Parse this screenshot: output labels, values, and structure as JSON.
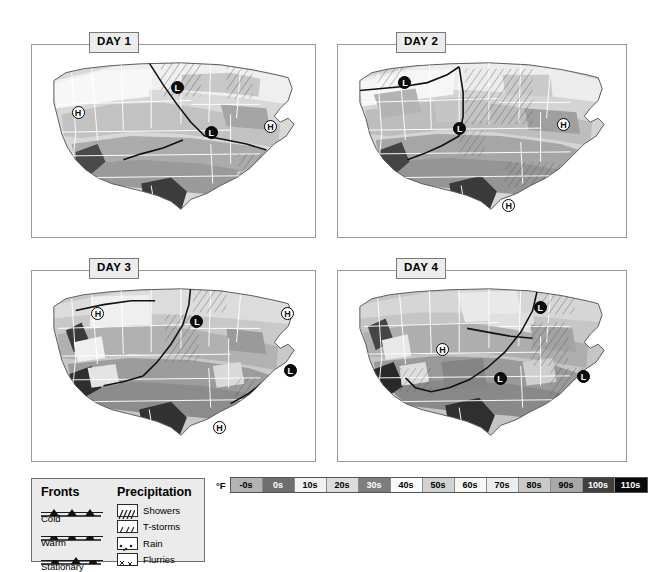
{
  "panels": [
    {
      "id": "day1",
      "label": "DAY 1",
      "markers": [
        {
          "type": "H",
          "x": 14,
          "y": 32
        },
        {
          "type": "L",
          "x": 49,
          "y": 19
        },
        {
          "type": "L",
          "x": 61,
          "y": 42
        },
        {
          "type": "H",
          "x": 82,
          "y": 39
        }
      ]
    },
    {
      "id": "day2",
      "label": "DAY 2",
      "markers": [
        {
          "type": "L",
          "x": 21,
          "y": 16
        },
        {
          "type": "L",
          "x": 40,
          "y": 40
        },
        {
          "type": "H",
          "x": 76,
          "y": 38
        },
        {
          "type": "H",
          "x": 57,
          "y": 80
        }
      ]
    },
    {
      "id": "day3",
      "label": "DAY 3",
      "markers": [
        {
          "type": "H",
          "x": 21,
          "y": 19
        },
        {
          "type": "L",
          "x": 56,
          "y": 23
        },
        {
          "type": "H",
          "x": 88,
          "y": 19
        },
        {
          "type": "L",
          "x": 89,
          "y": 49
        },
        {
          "type": "H",
          "x": 64,
          "y": 79
        }
      ]
    },
    {
      "id": "day4",
      "label": "DAY 4",
      "markers": [
        {
          "type": "L",
          "x": 68,
          "y": 16
        },
        {
          "type": "H",
          "x": 34,
          "y": 38
        },
        {
          "type": "L",
          "x": 54,
          "y": 53
        },
        {
          "type": "L",
          "x": 83,
          "y": 52
        }
      ]
    }
  ],
  "legend": {
    "fronts_heading": "Fronts",
    "precipitation_heading": "Precipitation",
    "fronts": [
      {
        "name": "Cold",
        "symbol": "cold-front-symbol"
      },
      {
        "name": "Warm",
        "symbol": "warm-front-symbol"
      },
      {
        "name": "Stationary",
        "symbol": "stationary-front-symbol"
      }
    ],
    "precipitation": [
      {
        "name": "Showers",
        "swatch": "showers-pattern"
      },
      {
        "name": "T-storms",
        "swatch": "tstorms-pattern"
      },
      {
        "name": "Rain",
        "swatch": "rain-pattern"
      },
      {
        "name": "Flurries",
        "swatch": "flurries-pattern"
      }
    ]
  },
  "temperature_scale": {
    "unit": "°F",
    "cells": [
      {
        "label": "-0s",
        "bg": "#b3b3b3",
        "fg": "#000000"
      },
      {
        "label": "0s",
        "bg": "#6e6e6e",
        "fg": "#ffffff"
      },
      {
        "label": "10s",
        "bg": "#f2f2f2",
        "fg": "#000000"
      },
      {
        "label": "20s",
        "bg": "#dcdcdc",
        "fg": "#000000"
      },
      {
        "label": "30s",
        "bg": "#7d7d7d",
        "fg": "#ffffff"
      },
      {
        "label": "40s",
        "bg": "#fbfbfb",
        "fg": "#000000"
      },
      {
        "label": "50s",
        "bg": "#d2d2d2",
        "fg": "#000000"
      },
      {
        "label": "60s",
        "bg": "#f7f7f7",
        "fg": "#000000"
      },
      {
        "label": "70s",
        "bg": "#ededed",
        "fg": "#000000"
      },
      {
        "label": "80s",
        "bg": "#c9c9c9",
        "fg": "#000000"
      },
      {
        "label": "90s",
        "bg": "#a8a8a8",
        "fg": "#000000"
      },
      {
        "label": "100s",
        "bg": "#3f3f3f",
        "fg": "#ffffff"
      },
      {
        "label": "110s",
        "bg": "#0a0a0a",
        "fg": "#ffffff"
      }
    ]
  }
}
